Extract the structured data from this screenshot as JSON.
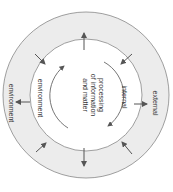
{
  "diagram": {
    "center_label_lines": [
      "processing",
      "of information",
      "and matter"
    ],
    "inner_ring_labels": {
      "left": "environment",
      "right": "internal"
    },
    "outer_ring_labels": {
      "left": "environment",
      "right": "external"
    },
    "orientation": "rotated 90 degrees clockwise",
    "colors": {
      "outer_ring_fill": "#ececec",
      "inner_fill": "#ffffff",
      "stroke": "#888888",
      "arrow": "#555555"
    }
  }
}
